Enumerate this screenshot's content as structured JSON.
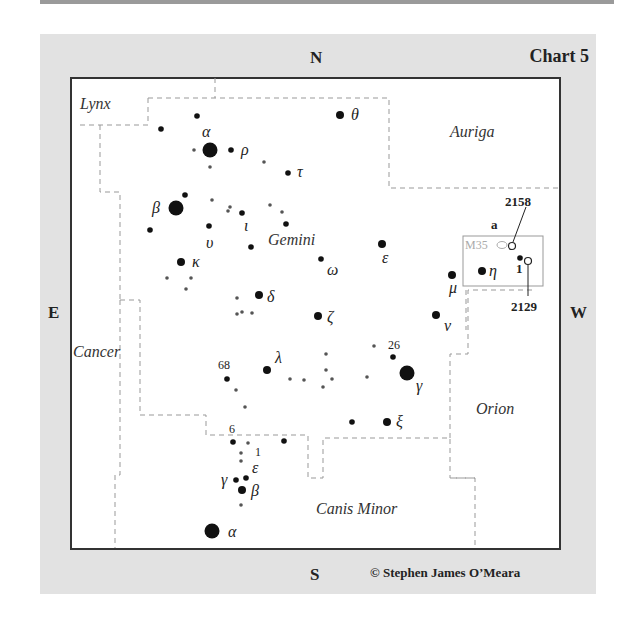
{
  "chart_title": "Chart 5",
  "directions": {
    "north": "N",
    "south": "S",
    "east": "E",
    "west": "W"
  },
  "credit": "© Stephen James O’Meara",
  "constellations": [
    "Lynx",
    "Auriga",
    "Gemini",
    "Cancer",
    "Orion",
    "Canis Minor"
  ],
  "labels": {
    "lynx": "Lynx",
    "auriga": "Auriga",
    "gemini": "Gemini",
    "cancer": "Cancer",
    "orion": "Orion",
    "canis_minor": "Canis Minor"
  },
  "stars": {
    "gem_alpha": "α",
    "gem_beta": "β",
    "gem_rho": "ρ",
    "gem_tau": "τ",
    "gem_theta": "θ",
    "gem_upsilon": "υ",
    "gem_iota": "ι",
    "gem_kappa": "κ",
    "gem_omega": "ω",
    "gem_epsilon": "ε",
    "gem_delta": "δ",
    "gem_zeta": "ζ",
    "gem_lambda": "λ",
    "gem_gamma": "γ",
    "gem_xi": "ξ",
    "gem_mu": "μ",
    "gem_nu": "ν",
    "gem_eta": "η",
    "gem_26": "26",
    "gem_68": "68",
    "cmi_6": "6",
    "cmi_1": "1",
    "cmi_epsilon": "ε",
    "cmi_gamma": "γ",
    "cmi_beta": "β",
    "cmi_alpha": "α"
  },
  "deep_sky": {
    "m35": "M35",
    "ngc2158": "2158",
    "ngc2129": "2129",
    "marker_a": "a",
    "marker_1": "1"
  }
}
